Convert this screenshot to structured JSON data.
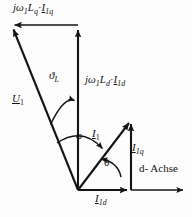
{
  "figure": {
    "type": "phasor-diagram",
    "title": "",
    "background_color": "#fdfdfd",
    "line_color": "#141414",
    "labels": {
      "u_q_drop": {
        "prefix": "j",
        "omega": "ω",
        "omega_sub": "1",
        "L": "L",
        "L_sub": "q",
        "dot": "·",
        "I": "I",
        "I_sub": "1q"
      },
      "u_d_drop": {
        "prefix": "j",
        "omega": "ω",
        "omega_sub": "1",
        "L": "L",
        "L_sub": "d",
        "dot": "·",
        "I": "I",
        "I_sub": "1d"
      },
      "load_angle": {
        "symbol": "ϑ",
        "sub": "L"
      },
      "voltage": {
        "symbol": "U",
        "sub": "1"
      },
      "power_factor_angle": {
        "symbol": "φ"
      },
      "current": {
        "symbol": "I",
        "sub": "1"
      },
      "current_q": {
        "symbol": "I",
        "sub": "1q"
      },
      "current_d": {
        "symbol": "I",
        "sub": "1d"
      },
      "torque_angle": {
        "symbol": "θ"
      },
      "d_axis": "d- Achse"
    }
  },
  "geometry": {
    "origin": {
      "x": 78,
      "y": 190
    },
    "vectors": [
      {
        "name": "U1",
        "from": [
          78,
          190
        ],
        "to": [
          12,
          27
        ]
      },
      {
        "name": "jw1Ld_I1d",
        "from": [
          78,
          190
        ],
        "to": [
          78,
          28
        ]
      },
      {
        "name": "jw1Lq_I1q",
        "from": [
          78,
          25
        ],
        "to": [
          13,
          25
        ]
      },
      {
        "name": "I1",
        "from": [
          78,
          190
        ],
        "to": [
          131,
          120
        ]
      },
      {
        "name": "I1q",
        "from": [
          131,
          190
        ],
        "to": [
          131,
          122
        ]
      },
      {
        "name": "I1d",
        "from": [
          78,
          190
        ],
        "to": [
          130,
          190
        ]
      },
      {
        "name": "d-axis",
        "from": [
          78,
          190
        ],
        "to": [
          186,
          190
        ]
      }
    ],
    "arcs": [
      {
        "name": "vartheta-L-arc",
        "from_deg": 112,
        "to_deg": 90,
        "radius": 72
      },
      {
        "name": "phi-arc",
        "from_deg": 112,
        "to_deg": 53,
        "radius": 56
      },
      {
        "name": "theta-arc",
        "from_deg": 53,
        "to_deg": 0,
        "radius": 42
      }
    ]
  }
}
